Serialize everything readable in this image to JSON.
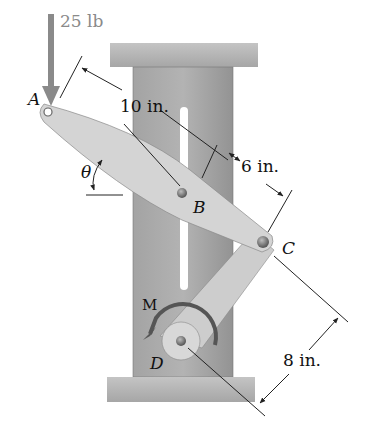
{
  "figure": {
    "load": {
      "value": "25 lb",
      "color": "#8a8a8a"
    },
    "points": {
      "A": "A",
      "B": "B",
      "C": "C",
      "D": "D"
    },
    "angle_label": "θ",
    "moment_label": "M",
    "dimensions": {
      "AB": "10 in.",
      "BC": "6 in.",
      "CD": "8 in."
    }
  },
  "colors": {
    "support": "#a9a9a9",
    "plate": "#9a9a9a",
    "link": "#cfcfcf",
    "pin": "#7a7a7a"
  }
}
